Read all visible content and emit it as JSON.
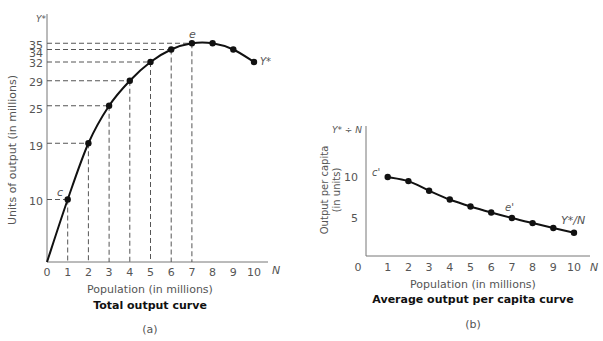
{
  "chart_data": [
    {
      "type": "line",
      "panel": "(a)",
      "title": "Total output curve",
      "xlabel": "Population (in millions)",
      "ylabel": "Units of output (in millions)",
      "x_axis_symbol": "N",
      "y_axis_symbol": "Y*",
      "curve_label": "Y*",
      "x": [
        0,
        1,
        2,
        3,
        4,
        5,
        6,
        7,
        8,
        9,
        10
      ],
      "values": [
        0,
        10,
        19,
        25,
        29,
        32,
        34,
        35,
        35,
        34,
        32
      ],
      "xticks": [
        "0",
        "1",
        "2",
        "3",
        "4",
        "5",
        "6",
        "7",
        "8",
        "9",
        "10"
      ],
      "yticks": [
        "10",
        "19",
        "25",
        "29",
        "32",
        "34",
        "35"
      ],
      "annotations": [
        {
          "label": "c",
          "x": 1,
          "y": 10
        },
        {
          "label": "e",
          "x": 7,
          "y": 35
        }
      ],
      "grid": false,
      "dashed_guides": true
    },
    {
      "type": "line",
      "panel": "(b)",
      "title": "Average output per capita curve",
      "xlabel": "Population (in millions)",
      "ylabel": "Output per capita (in units)",
      "x_axis_symbol": "N",
      "y_axis_symbol": "Y* ÷ N",
      "curve_label": "Y*/N",
      "x": [
        1,
        2,
        3,
        4,
        5,
        6,
        7,
        8,
        9,
        10
      ],
      "values": [
        10,
        9.5,
        8.33,
        7.25,
        6.4,
        5.67,
        5,
        4.38,
        3.78,
        3.2
      ],
      "xticks": [
        "0",
        "1",
        "2",
        "3",
        "4",
        "5",
        "6",
        "7",
        "8",
        "9",
        "10"
      ],
      "yticks": [
        "5",
        "10"
      ],
      "annotations": [
        {
          "label": "c'",
          "x": 1,
          "y": 10
        },
        {
          "label": "e'",
          "x": 7,
          "y": 5
        }
      ],
      "grid": false
    }
  ],
  "left": {
    "y_symbol": "Y*",
    "ylabel": "Units of output (in millions)",
    "xlabel": "Population (in millions)",
    "title": "Total output curve",
    "panel": "(a)",
    "n_symbol": "N",
    "curve_label": "Y*",
    "point_c": "c",
    "point_e": "e"
  },
  "right": {
    "y_symbol": "Y* ÷ N",
    "ylabel_1": "Output per capita",
    "ylabel_2": "(in units)",
    "xlabel": "Population (in millions)",
    "title": "Average output per capita curve",
    "panel": "(b)",
    "n_symbol": "N",
    "curve_label": "Y*/N",
    "point_c": "c'",
    "point_e": "e'"
  }
}
